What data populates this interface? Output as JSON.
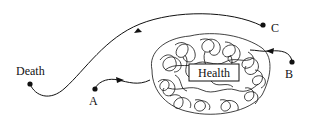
{
  "diagram": {
    "center_label": "Health",
    "points": [
      {
        "id": "death",
        "label": "Death"
      },
      {
        "id": "a",
        "label": "A"
      },
      {
        "id": "b",
        "label": "B"
      },
      {
        "id": "c",
        "label": "C"
      }
    ],
    "colors": {
      "stroke": "#111111",
      "background": "#ffffff"
    }
  }
}
